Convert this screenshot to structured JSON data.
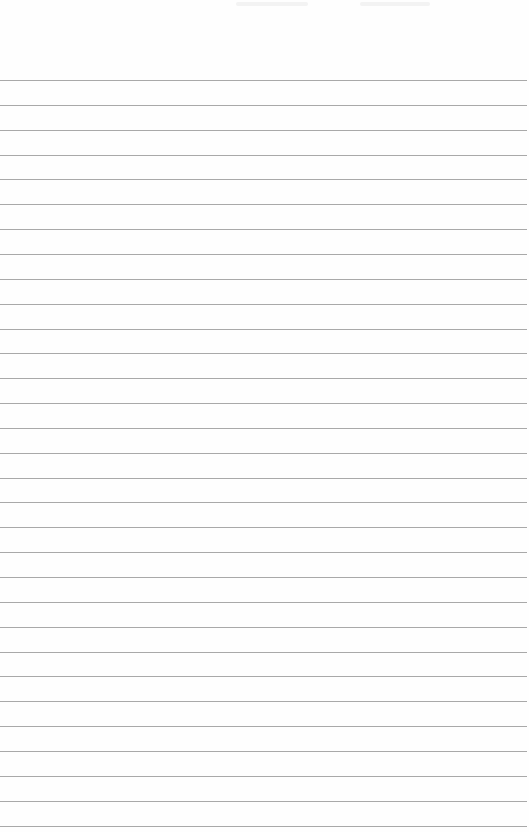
{
  "page": {
    "type": "ruled-notepaper",
    "background": "#fefefe",
    "rule_color": "#a9a9a9",
    "first_rule_y": 80,
    "rule_spacing": 24.85,
    "rule_count": 31,
    "rule_width": 527,
    "margin_line": false
  },
  "top_artifacts": [
    {
      "x": 236,
      "width": 72
    },
    {
      "x": 360,
      "width": 70
    }
  ]
}
